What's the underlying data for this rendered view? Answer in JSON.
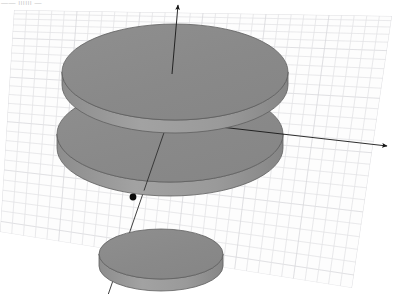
{
  "viewport": {
    "width": 396,
    "height": 294,
    "background_color": "#ffffff",
    "header_text": "——  ıııııı —"
  },
  "grid": {
    "name": "ground-plane-grid",
    "line_color": "#e3e3e6",
    "line_color_strong": "#d8d8dc",
    "plane_fill": "#fdfdfd",
    "rows": 26,
    "cols": 30,
    "corners": {
      "top_left": [
        14,
        10
      ],
      "top_right": [
        392,
        16
      ],
      "bottom_right": [
        352,
        288
      ],
      "bottom_left": [
        0,
        232
      ]
    }
  },
  "disks": [
    {
      "id": "disk-upper",
      "label": "upper-disk",
      "center": [
        175,
        72
      ],
      "rx": 113,
      "ry": 48,
      "thickness": 13,
      "top_color": "#8b8b8b",
      "side_color": "#9b9b9b",
      "outline_color": "#5f5f5f"
    },
    {
      "id": "disk-middle",
      "label": "middle-disk",
      "center": [
        170,
        134
      ],
      "rx": 113,
      "ry": 48,
      "thickness": 14,
      "top_color": "#8b8b8b",
      "side_color": "#9b9b9b",
      "outline_color": "#5f5f5f"
    },
    {
      "id": "disk-lower-small",
      "label": "lower-small-disk",
      "center": [
        161,
        254
      ],
      "rx": 62,
      "ry": 25,
      "thickness": 12,
      "top_color": "#8b8b8b",
      "side_color": "#9b9b9b",
      "outline_color": "#5f5f5f"
    }
  ],
  "axes": {
    "origin": [
      168,
      121
    ],
    "color": "#161616",
    "stroke_width": 0.9,
    "vertical_axis": {
      "name": "vertical-axis-arrow",
      "from": [
        172,
        74
      ],
      "to": [
        178,
        5
      ],
      "arrowhead": true
    },
    "horizontal_axis": {
      "name": "horizontal-axis-arrow",
      "from": [
        168,
        121
      ],
      "to": [
        387,
        146
      ],
      "arrowhead": true
    },
    "diagonal_axis": {
      "name": "diagonal-axis-line",
      "from": [
        168,
        121
      ],
      "to": [
        108,
        295
      ],
      "arrowhead": false
    },
    "point_marker": {
      "name": "origin-point-marker",
      "position": [
        133,
        197
      ],
      "radius": 3.4,
      "color": "#0b0b0b"
    }
  }
}
